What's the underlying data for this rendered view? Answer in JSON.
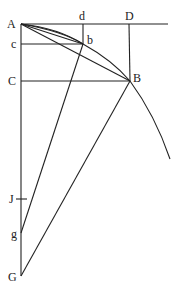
{
  "labels": {
    "A": "A",
    "d": "d",
    "D": "D",
    "c": "c",
    "b": "b",
    "C": "C",
    "B": "B",
    "J": "J",
    "g": "g",
    "G": "G"
  },
  "points": {
    "A": [
      21,
      24
    ],
    "d": [
      83,
      24
    ],
    "D": [
      129,
      24
    ],
    "c": [
      21,
      44
    ],
    "b": [
      83,
      44
    ],
    "C": [
      21,
      81
    ],
    "B": [
      130,
      81
    ],
    "J": [
      21,
      199
    ],
    "g": [
      21,
      233
    ],
    "G": [
      21,
      276
    ]
  },
  "colors": {
    "stroke": "#222222",
    "background": "#ffffff"
  }
}
